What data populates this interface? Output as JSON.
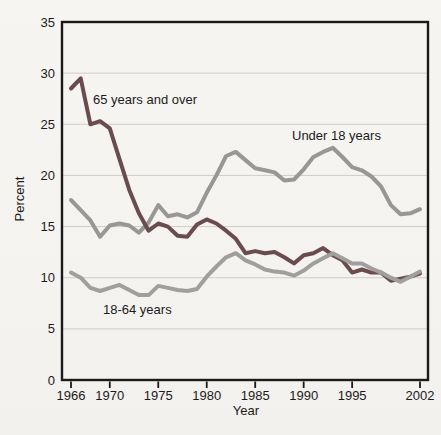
{
  "chart_data": {
    "type": "line",
    "title": "",
    "xlabel": "Year",
    "ylabel": "Percent",
    "xlim": [
      1966,
      2002
    ],
    "ylim": [
      0,
      35
    ],
    "xticks": [
      1966,
      1970,
      1975,
      1980,
      1985,
      1990,
      1995,
      2002
    ],
    "yticks": [
      0,
      5,
      10,
      15,
      20,
      25,
      30,
      35
    ],
    "grid": "horizontal",
    "legend_position": "inline-annotations",
    "colors": {
      "frame": "#1a1a1a",
      "grid": "#cfcdc9",
      "paper": "#f5f4f1"
    },
    "draw_order": [
      1,
      0,
      2
    ],
    "x": [
      1966,
      1967,
      1968,
      1969,
      1970,
      1971,
      1972,
      1973,
      1974,
      1975,
      1976,
      1977,
      1978,
      1979,
      1980,
      1981,
      1982,
      1983,
      1984,
      1985,
      1986,
      1987,
      1988,
      1989,
      1990,
      1991,
      1992,
      1993,
      1994,
      1995,
      1996,
      1997,
      1998,
      1999,
      2000,
      2001,
      2002
    ],
    "series": [
      {
        "name": "65 years and over",
        "color": "#6b4c4e",
        "values": [
          28.5,
          29.5,
          25.0,
          25.3,
          24.6,
          21.6,
          18.6,
          16.3,
          14.6,
          15.3,
          15.0,
          14.1,
          14.0,
          15.2,
          15.7,
          15.3,
          14.6,
          13.8,
          12.4,
          12.6,
          12.4,
          12.5,
          12.0,
          11.4,
          12.2,
          12.4,
          12.9,
          12.2,
          11.7,
          10.5,
          10.8,
          10.5,
          10.5,
          9.7,
          9.9,
          10.1,
          10.4
        ]
      },
      {
        "name": "Under 18 years",
        "color": "#989795",
        "values": [
          17.6,
          16.6,
          15.6,
          14.0,
          15.1,
          15.3,
          15.1,
          14.4,
          15.4,
          17.1,
          16.0,
          16.2,
          15.9,
          16.4,
          18.3,
          20.0,
          21.9,
          22.3,
          21.5,
          20.7,
          20.5,
          20.3,
          19.5,
          19.6,
          20.6,
          21.8,
          22.3,
          22.7,
          21.8,
          20.8,
          20.5,
          19.9,
          18.9,
          17.1,
          16.2,
          16.3,
          16.7
        ]
      },
      {
        "name": "18-64 years",
        "color": "#a09f9d",
        "values": [
          10.5,
          10.0,
          9.0,
          8.7,
          9.0,
          9.3,
          8.8,
          8.3,
          8.3,
          9.2,
          9.0,
          8.8,
          8.7,
          8.9,
          10.1,
          11.1,
          12.0,
          12.4,
          11.7,
          11.3,
          10.8,
          10.6,
          10.5,
          10.2,
          10.7,
          11.4,
          11.9,
          12.4,
          11.9,
          11.4,
          11.4,
          10.9,
          10.5,
          10.0,
          9.6,
          10.1,
          10.6
        ]
      }
    ]
  }
}
